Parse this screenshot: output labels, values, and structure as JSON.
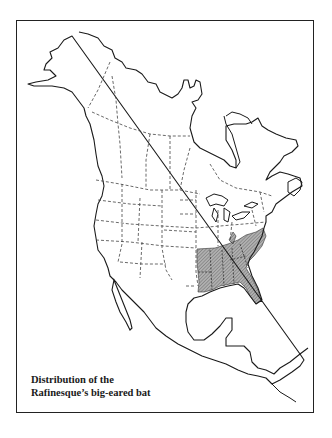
{
  "map": {
    "title_line1": "Distribution of the",
    "title_line2": "Rafinesque’s big-eared bat",
    "region": "North America",
    "species": "Rafinesque’s big-eared bat",
    "shaded_range": "Southeastern United States",
    "colors": {
      "border": "#222222",
      "coast": "#1a1a1a",
      "political_border": "#444444",
      "range_fill": "#9a9a9a",
      "background": "#ffffff"
    }
  }
}
